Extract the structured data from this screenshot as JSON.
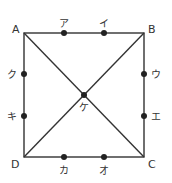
{
  "diagram": {
    "vertices": {
      "A": "A",
      "B": "B",
      "C": "C",
      "D": "D"
    },
    "center": "ケ",
    "points": {
      "a": "ア",
      "i": "イ",
      "u": "ウ",
      "e": "エ",
      "o": "オ",
      "ka": "カ",
      "ki": "キ",
      "ku": "ク"
    },
    "line_color": "#333333"
  }
}
